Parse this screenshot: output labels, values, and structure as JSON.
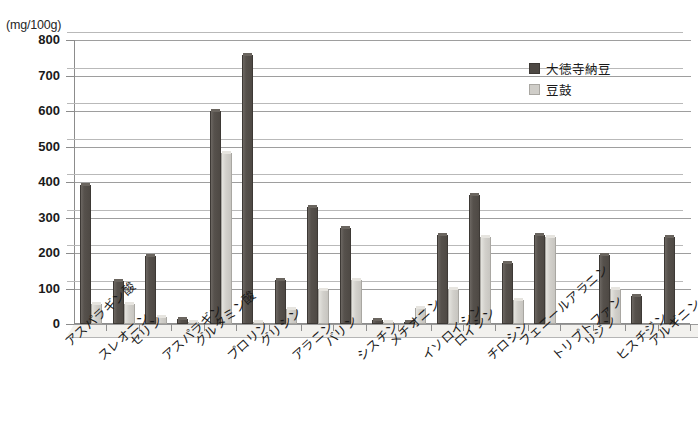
{
  "chart_data": {
    "type": "bar",
    "title": "",
    "unit_caption": "(mg/100g)",
    "xlabel": "",
    "ylabel": "",
    "ylim": [
      0,
      800
    ],
    "yticks": [
      0,
      100,
      200,
      300,
      400,
      500,
      600,
      700,
      800
    ],
    "ytick_labels": [
      "0",
      "100",
      "200",
      "300",
      "400",
      "500",
      "600",
      "700",
      "800"
    ],
    "grid": true,
    "legend_position": "upper-right",
    "categories": [
      "アスパラギン酸",
      "スレオニン",
      "セリン",
      "アスパラギン",
      "グルタミン酸",
      "プロリン",
      "グリシン",
      "アラニン",
      "バリン",
      "シスチン",
      "メチオニン",
      "イソロイシン",
      "ロイシン",
      "チロシン",
      "フェニールアラニン",
      "トリプトファン",
      "リジン",
      "ヒスチジン",
      "アルギニン"
    ],
    "series": [
      {
        "name": "大徳寺納豆",
        "color": "#4e4944",
        "values": [
          393,
          122,
          193,
          13,
          600,
          757,
          123,
          330,
          270,
          12,
          5,
          250,
          363,
          172,
          250,
          0,
          195,
          78,
          245
        ]
      },
      {
        "name": "豆鼓",
        "color": "#cfcdc8",
        "values": [
          57,
          57,
          20,
          5,
          483,
          2,
          42,
          97,
          125,
          3,
          45,
          98,
          245,
          68,
          245,
          0,
          98,
          0,
          0
        ]
      }
    ]
  },
  "colors": {
    "bar_dark": "#4e4944",
    "bar_light": "#cfcdc8",
    "axis": "#8c8c8c",
    "gridline": "#9e9e9e",
    "text": "#1a1a1a",
    "background": "#ffffff"
  }
}
